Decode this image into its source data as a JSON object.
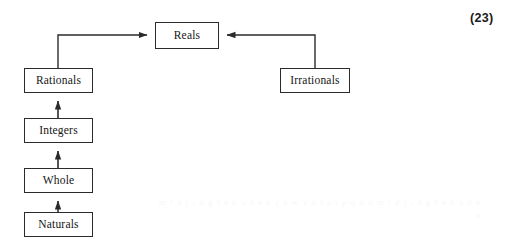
{
  "document": {
    "page_number_label": "(23)",
    "background_color": "#ffffff",
    "line_color": "#2b2b2b",
    "text_color": "#151515"
  },
  "diagram": {
    "type": "hierarchy-flow",
    "title": "",
    "nodes": [
      {
        "id": "reals",
        "label": "Reals",
        "x": 155,
        "y": 22,
        "w": 64,
        "h": 27
      },
      {
        "id": "rationals",
        "label": "Rationals",
        "x": 24,
        "y": 68,
        "w": 69,
        "h": 25
      },
      {
        "id": "irrationals",
        "label": "Irrationals",
        "x": 280,
        "y": 68,
        "w": 70,
        "h": 25
      },
      {
        "id": "integers",
        "label": "Integers",
        "x": 24,
        "y": 118,
        "w": 69,
        "h": 25
      },
      {
        "id": "whole",
        "label": "Whole",
        "x": 24,
        "y": 168,
        "w": 69,
        "h": 25
      },
      {
        "id": "naturals",
        "label": "Naturals",
        "x": 24,
        "y": 212,
        "w": 69,
        "h": 25
      }
    ],
    "edges": [
      {
        "from": "rationals",
        "to": "reals",
        "style": "elbow-up-right",
        "arrow": "to"
      },
      {
        "from": "irrationals",
        "to": "reals",
        "style": "elbow-up-left",
        "arrow": "to"
      },
      {
        "from": "integers",
        "to": "rationals",
        "style": "straight-up",
        "arrow": "to"
      },
      {
        "from": "whole",
        "to": "integers",
        "style": "straight-up",
        "arrow": "to"
      },
      {
        "from": "naturals",
        "to": "whole",
        "style": "straight-up",
        "arrow": "to"
      }
    ]
  },
  "artifacts": {
    "bleed_through_text": "a b c d e f g h i j k l m n o p q r s t u v w x y z a b c d e f g h i j k l m n"
  }
}
